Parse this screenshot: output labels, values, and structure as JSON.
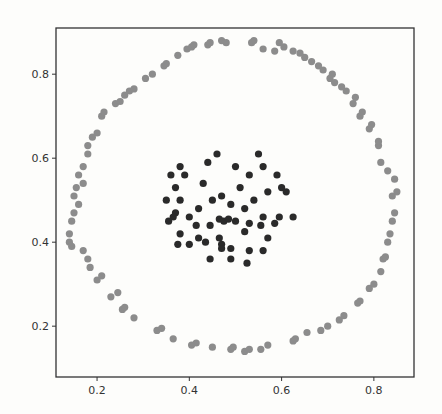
{
  "chart_data": {
    "type": "scatter",
    "title": "",
    "xlabel": "",
    "ylabel": "",
    "xlim": [
      0.111,
      0.887
    ],
    "ylim": [
      0.079,
      0.91
    ],
    "xticks": [
      0.2,
      0.4,
      0.6,
      0.8
    ],
    "yticks": [
      0.2,
      0.4,
      0.6,
      0.8
    ],
    "xtick_labels": [
      "0.2",
      "0.4",
      "0.6",
      "0.8"
    ],
    "ytick_labels": [
      "0.2",
      "0.4",
      "0.6",
      "0.8"
    ],
    "grid": false,
    "legend": null,
    "series": [
      {
        "name": "outer ring",
        "color": "#8c8c8c",
        "points": [
          [
            0.14,
            0.4
          ],
          [
            0.14,
            0.42
          ],
          [
            0.145,
            0.45
          ],
          [
            0.15,
            0.47
          ],
          [
            0.16,
            0.49
          ],
          [
            0.15,
            0.51
          ],
          [
            0.155,
            0.53
          ],
          [
            0.17,
            0.54
          ],
          [
            0.16,
            0.56
          ],
          [
            0.17,
            0.58
          ],
          [
            0.18,
            0.61
          ],
          [
            0.18,
            0.63
          ],
          [
            0.19,
            0.65
          ],
          [
            0.2,
            0.66
          ],
          [
            0.21,
            0.7
          ],
          [
            0.215,
            0.71
          ],
          [
            0.145,
            0.39
          ],
          [
            0.17,
            0.38
          ],
          [
            0.18,
            0.36
          ],
          [
            0.185,
            0.34
          ],
          [
            0.2,
            0.31
          ],
          [
            0.21,
            0.32
          ],
          [
            0.23,
            0.27
          ],
          [
            0.245,
            0.28
          ],
          [
            0.255,
            0.24
          ],
          [
            0.26,
            0.245
          ],
          [
            0.28,
            0.22
          ],
          [
            0.33,
            0.19
          ],
          [
            0.34,
            0.195
          ],
          [
            0.365,
            0.17
          ],
          [
            0.405,
            0.155
          ],
          [
            0.415,
            0.16
          ],
          [
            0.45,
            0.15
          ],
          [
            0.49,
            0.145
          ],
          [
            0.495,
            0.15
          ],
          [
            0.52,
            0.14
          ],
          [
            0.53,
            0.145
          ],
          [
            0.555,
            0.145
          ],
          [
            0.57,
            0.155
          ],
          [
            0.625,
            0.165
          ],
          [
            0.63,
            0.17
          ],
          [
            0.655,
            0.185
          ],
          [
            0.685,
            0.19
          ],
          [
            0.7,
            0.2
          ],
          [
            0.725,
            0.215
          ],
          [
            0.735,
            0.225
          ],
          [
            0.765,
            0.255
          ],
          [
            0.77,
            0.26
          ],
          [
            0.79,
            0.29
          ],
          [
            0.8,
            0.3
          ],
          [
            0.815,
            0.33
          ],
          [
            0.82,
            0.36
          ],
          [
            0.825,
            0.365
          ],
          [
            0.83,
            0.4
          ],
          [
            0.835,
            0.42
          ],
          [
            0.84,
            0.45
          ],
          [
            0.845,
            0.47
          ],
          [
            0.84,
            0.51
          ],
          [
            0.85,
            0.52
          ],
          [
            0.845,
            0.55
          ],
          [
            0.83,
            0.57
          ],
          [
            0.815,
            0.59
          ],
          [
            0.81,
            0.63
          ],
          [
            0.81,
            0.64
          ],
          [
            0.79,
            0.67
          ],
          [
            0.795,
            0.68
          ],
          [
            0.77,
            0.7
          ],
          [
            0.775,
            0.71
          ],
          [
            0.755,
            0.73
          ],
          [
            0.76,
            0.745
          ],
          [
            0.74,
            0.76
          ],
          [
            0.73,
            0.77
          ],
          [
            0.715,
            0.78
          ],
          [
            0.705,
            0.79
          ],
          [
            0.71,
            0.8
          ],
          [
            0.69,
            0.81
          ],
          [
            0.68,
            0.82
          ],
          [
            0.665,
            0.83
          ],
          [
            0.65,
            0.84
          ],
          [
            0.64,
            0.85
          ],
          [
            0.625,
            0.855
          ],
          [
            0.605,
            0.865
          ],
          [
            0.585,
            0.855
          ],
          [
            0.595,
            0.875
          ],
          [
            0.24,
            0.73
          ],
          [
            0.25,
            0.735
          ],
          [
            0.26,
            0.75
          ],
          [
            0.27,
            0.76
          ],
          [
            0.28,
            0.765
          ],
          [
            0.305,
            0.79
          ],
          [
            0.32,
            0.8
          ],
          [
            0.345,
            0.82
          ],
          [
            0.35,
            0.825
          ],
          [
            0.375,
            0.845
          ],
          [
            0.395,
            0.86
          ],
          [
            0.405,
            0.865
          ],
          [
            0.41,
            0.87
          ],
          [
            0.44,
            0.87
          ],
          [
            0.445,
            0.875
          ],
          [
            0.47,
            0.88
          ],
          [
            0.48,
            0.875
          ],
          [
            0.535,
            0.875
          ],
          [
            0.54,
            0.88
          ],
          [
            0.56,
            0.86
          ]
        ]
      },
      {
        "name": "inner cluster",
        "color": "#2a2a2a",
        "points": [
          [
            0.46,
            0.61
          ],
          [
            0.55,
            0.61
          ],
          [
            0.38,
            0.58
          ],
          [
            0.44,
            0.59
          ],
          [
            0.5,
            0.58
          ],
          [
            0.56,
            0.58
          ],
          [
            0.36,
            0.56
          ],
          [
            0.39,
            0.56
          ],
          [
            0.53,
            0.56
          ],
          [
            0.59,
            0.56
          ],
          [
            0.37,
            0.53
          ],
          [
            0.43,
            0.54
          ],
          [
            0.51,
            0.53
          ],
          [
            0.6,
            0.53
          ],
          [
            0.57,
            0.52
          ],
          [
            0.61,
            0.52
          ],
          [
            0.35,
            0.5
          ],
          [
            0.38,
            0.5
          ],
          [
            0.47,
            0.51
          ],
          [
            0.45,
            0.5
          ],
          [
            0.54,
            0.5
          ],
          [
            0.49,
            0.49
          ],
          [
            0.52,
            0.48
          ],
          [
            0.42,
            0.48
          ],
          [
            0.37,
            0.47
          ],
          [
            0.365,
            0.46
          ],
          [
            0.4,
            0.46
          ],
          [
            0.355,
            0.45
          ],
          [
            0.465,
            0.455
          ],
          [
            0.475,
            0.45
          ],
          [
            0.485,
            0.455
          ],
          [
            0.5,
            0.45
          ],
          [
            0.56,
            0.46
          ],
          [
            0.595,
            0.46
          ],
          [
            0.625,
            0.46
          ],
          [
            0.445,
            0.44
          ],
          [
            0.415,
            0.44
          ],
          [
            0.53,
            0.445
          ],
          [
            0.555,
            0.44
          ],
          [
            0.585,
            0.445
          ],
          [
            0.38,
            0.42
          ],
          [
            0.42,
            0.41
          ],
          [
            0.465,
            0.41
          ],
          [
            0.52,
            0.425
          ],
          [
            0.57,
            0.41
          ],
          [
            0.375,
            0.395
          ],
          [
            0.4,
            0.395
          ],
          [
            0.435,
            0.4
          ],
          [
            0.47,
            0.395
          ],
          [
            0.47,
            0.385
          ],
          [
            0.49,
            0.385
          ],
          [
            0.53,
            0.38
          ],
          [
            0.445,
            0.36
          ],
          [
            0.49,
            0.36
          ],
          [
            0.525,
            0.35
          ],
          [
            0.56,
            0.38
          ]
        ]
      }
    ]
  }
}
